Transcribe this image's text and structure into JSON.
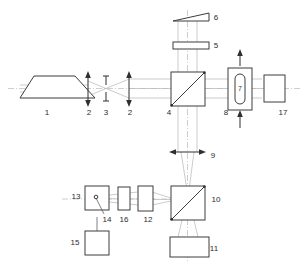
{
  "diagram": {
    "background_color": "#ffffff",
    "line_color": "#3c3c3c",
    "ray_color": "#b6b6b6",
    "label_color": "#2b2b2b",
    "labels": [
      {
        "id": "1",
        "text": "1",
        "x": 47,
        "y": 113,
        "component": "laser-source-trapezoid"
      },
      {
        "id": "2a",
        "text": "2",
        "x": 89,
        "y": 113,
        "component": "beam-expander-lens-front"
      },
      {
        "id": "3",
        "text": "3",
        "x": 106,
        "y": 113,
        "component": "pinhole-aperture"
      },
      {
        "id": "2b",
        "text": "2",
        "x": 130,
        "y": 113,
        "component": "beam-expander-lens-back"
      },
      {
        "id": "4",
        "text": "4",
        "x": 169,
        "y": 113,
        "component": "beamsplitter-cube-upper"
      },
      {
        "id": "5",
        "text": "5",
        "x": 216,
        "y": 46,
        "component": "waveplate-plate"
      },
      {
        "id": "6",
        "text": "6",
        "x": 216,
        "y": 18,
        "component": "wedge-mirror"
      },
      {
        "id": "7",
        "text": "7",
        "x": 241,
        "y": 89,
        "component": "sample-oval-inner"
      },
      {
        "id": "8",
        "text": "8",
        "x": 226,
        "y": 113,
        "component": "flow-cell-body"
      },
      {
        "id": "9",
        "text": "9",
        "x": 213,
        "y": 156,
        "component": "collimating-lens-lower"
      },
      {
        "id": "10",
        "text": "10",
        "x": 215,
        "y": 200,
        "component": "beamsplitter-cube-lower"
      },
      {
        "id": "11",
        "text": "11",
        "x": 213,
        "y": 249,
        "component": "detector-wide"
      },
      {
        "id": "12",
        "text": "12",
        "x": 148,
        "y": 220,
        "component": "focusing-lens-left"
      },
      {
        "id": "13",
        "text": "13",
        "x": 76,
        "y": 197,
        "component": "detector-box-left"
      },
      {
        "id": "14",
        "text": "14",
        "x": 107,
        "y": 220,
        "component": "pinhole-point"
      },
      {
        "id": "15",
        "text": "15",
        "x": 75,
        "y": 243,
        "component": "lower-module-box"
      },
      {
        "id": "16",
        "text": "16",
        "x": 124,
        "y": 220,
        "component": "filter-plate"
      },
      {
        "id": "17",
        "text": "17",
        "x": 283,
        "y": 113,
        "component": "end-detector-right"
      }
    ],
    "components": [
      {
        "name": "laser-source-trapezoid",
        "label": "1",
        "shape": "trapezoid"
      },
      {
        "name": "beam-expander-lens-front",
        "label": "2",
        "shape": "double-arrow-lens-vertical"
      },
      {
        "name": "pinhole-aperture",
        "label": "3",
        "shape": "slit"
      },
      {
        "name": "beam-expander-lens-back",
        "label": "2",
        "shape": "double-arrow-lens-vertical"
      },
      {
        "name": "beamsplitter-cube-upper",
        "label": "4",
        "shape": "square-with-diagonal"
      },
      {
        "name": "waveplate-plate",
        "label": "5",
        "shape": "thin-horizontal-plate"
      },
      {
        "name": "wedge-mirror",
        "label": "6",
        "shape": "wedge"
      },
      {
        "name": "sample-oval-inner",
        "label": "7",
        "shape": "rounded-oval"
      },
      {
        "name": "flow-cell-body",
        "label": "8",
        "shape": "tall-rectangle-with-flow-arrows"
      },
      {
        "name": "collimating-lens-lower",
        "label": "9",
        "shape": "double-arrow-lens-horizontal"
      },
      {
        "name": "beamsplitter-cube-lower",
        "label": "10",
        "shape": "square-with-diagonal"
      },
      {
        "name": "detector-wide",
        "label": "11",
        "shape": "wide-rectangle"
      },
      {
        "name": "focusing-lens-left",
        "label": "12",
        "shape": "tall-rectangle"
      },
      {
        "name": "detector-box-left",
        "label": "13",
        "shape": "square-with-point"
      },
      {
        "name": "pinhole-point",
        "label": "14",
        "shape": "point-marker"
      },
      {
        "name": "lower-module-box",
        "label": "15",
        "shape": "square"
      },
      {
        "name": "filter-plate",
        "label": "16",
        "shape": "tall-rectangle"
      },
      {
        "name": "end-detector-right",
        "label": "17",
        "shape": "tall-rectangle"
      }
    ]
  }
}
